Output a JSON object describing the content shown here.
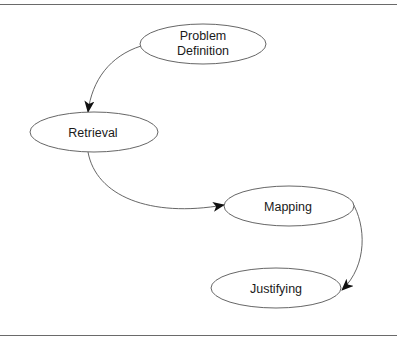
{
  "diagram": {
    "type": "flow",
    "nodes": [
      {
        "id": "problem-definition",
        "lines": [
          "Problem",
          "Definition"
        ],
        "cx": 203,
        "cy": 44,
        "rx": 63,
        "ry": 20
      },
      {
        "id": "retrieval",
        "lines": [
          "Retrieval"
        ],
        "cx": 94,
        "cy": 132,
        "rx": 64,
        "ry": 20
      },
      {
        "id": "mapping",
        "lines": [
          "Mapping"
        ],
        "cx": 289,
        "cy": 206,
        "rx": 65,
        "ry": 20
      },
      {
        "id": "justifying",
        "lines": [
          "Justifying"
        ],
        "cx": 276,
        "cy": 288,
        "rx": 65,
        "ry": 20
      }
    ],
    "edges": [
      {
        "from": "problem-definition",
        "to": "retrieval"
      },
      {
        "from": "retrieval",
        "to": "mapping"
      },
      {
        "from": "mapping",
        "to": "justifying"
      }
    ],
    "colors": {
      "stroke": "#555555",
      "arrow": "#111111",
      "rule": "#6a6a6a"
    }
  }
}
